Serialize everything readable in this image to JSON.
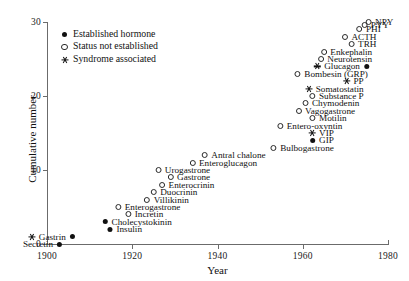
{
  "chart_data": {
    "type": "scatter",
    "title": "",
    "xlabel": "Year",
    "ylabel": "Cumulative number",
    "xlim": [
      1900,
      1980
    ],
    "ylim": [
      0,
      30
    ],
    "xticks": [
      "1900",
      "1920",
      "1940",
      "1960",
      "1980"
    ],
    "xtick_values": [
      1900,
      1920,
      1940,
      1960,
      1980
    ],
    "yticks": [
      "0",
      "10",
      "20",
      "30"
    ],
    "ytick_values": [
      0,
      10,
      20,
      30
    ],
    "grid": false,
    "legend_position": "top-left",
    "legend": [
      {
        "marker": "filled-circle",
        "label": "Established hormone"
      },
      {
        "marker": "open-circle",
        "label": "Status not established"
      },
      {
        "marker": "star",
        "label": "Syndrome associated"
      }
    ],
    "points": [
      {
        "label": "Secretin",
        "year": 1902,
        "value": 0,
        "markers": [
          "filled-circle"
        ],
        "marker_side": "right"
      },
      {
        "label": "Gastrin",
        "year": 1905,
        "value": 1,
        "markers": [
          "star",
          "filled-circle"
        ],
        "marker_side": "both"
      },
      {
        "label": "Insulin",
        "year": 1921,
        "value": 2,
        "markers": [
          "filled-circle"
        ],
        "marker_side": "left"
      },
      {
        "label": "Cholecystokinin",
        "year": 1928,
        "value": 3,
        "markers": [
          "filled-circle"
        ],
        "marker_side": "left"
      },
      {
        "label": "Incretin",
        "year": 1926,
        "value": 4,
        "markers": [
          "open-circle"
        ],
        "marker_side": "left"
      },
      {
        "label": "Enterogastrone",
        "year": 1930,
        "value": 5,
        "markers": [
          "open-circle"
        ],
        "marker_side": "left"
      },
      {
        "label": "Villikinin",
        "year": 1932,
        "value": 6,
        "markers": [
          "open-circle"
        ],
        "marker_side": "left"
      },
      {
        "label": "Duocrinin",
        "year": 1934,
        "value": 7,
        "markers": [
          "open-circle"
        ],
        "marker_side": "left"
      },
      {
        "label": "Enterocrinin",
        "year": 1938,
        "value": 8,
        "markers": [
          "open-circle"
        ],
        "marker_side": "left"
      },
      {
        "label": "Gastrone",
        "year": 1937,
        "value": 9,
        "markers": [
          "open-circle"
        ],
        "marker_side": "left"
      },
      {
        "label": "Urogastrone",
        "year": 1937,
        "value": 10,
        "markers": [
          "open-circle"
        ],
        "marker_side": "left"
      },
      {
        "label": "Enteroglucagon",
        "year": 1948,
        "value": 11,
        "markers": [
          "open-circle"
        ],
        "marker_side": "left"
      },
      {
        "label": "Antral chalone",
        "year": 1950,
        "value": 12,
        "markers": [
          "open-circle"
        ],
        "marker_side": "left"
      },
      {
        "label": "Bulbogastrone",
        "year": 1966,
        "value": 13,
        "markers": [
          "open-circle"
        ],
        "marker_side": "left"
      },
      {
        "label": "GIP",
        "year": 1966,
        "value": 14,
        "markers": [
          "filled-circle"
        ],
        "marker_side": "left"
      },
      {
        "label": "VIP",
        "year": 1966,
        "value": 15,
        "markers": [
          "star"
        ],
        "marker_side": "left"
      },
      {
        "label": "Entero-oxyntin",
        "year": 1968,
        "value": 16,
        "markers": [
          "open-circle"
        ],
        "marker_side": "left"
      },
      {
        "label": "Motilin",
        "year": 1969,
        "value": 17,
        "markers": [
          "open-circle"
        ],
        "marker_side": "left"
      },
      {
        "label": "Vagogastrone",
        "year": 1971,
        "value": 18,
        "markers": [
          "open-circle"
        ],
        "marker_side": "left"
      },
      {
        "label": "Chymodenin",
        "year": 1972,
        "value": 19,
        "markers": [
          "open-circle"
        ],
        "marker_side": "left"
      },
      {
        "label": "Substance P",
        "year": 1973,
        "value": 20,
        "markers": [
          "open-circle"
        ],
        "marker_side": "left"
      },
      {
        "label": "Somatostatin",
        "year": 1973,
        "value": 21,
        "markers": [
          "star"
        ],
        "marker_side": "left"
      },
      {
        "label": "PP",
        "year": 1973,
        "value": 22,
        "markers": [
          "star"
        ],
        "marker_side": "left"
      },
      {
        "label": "Bombesin (GRP)",
        "year": 1974,
        "value": 23,
        "markers": [
          "open-circle"
        ],
        "marker_side": "left"
      },
      {
        "label": "Glucagon",
        "year": 1974,
        "value": 24,
        "markers": [
          "star",
          "filled-circle"
        ],
        "marker_side": "both"
      },
      {
        "label": "Neurotensin",
        "year": 1975,
        "value": 25,
        "markers": [
          "open-circle"
        ],
        "marker_side": "left"
      },
      {
        "label": "Enkephalin",
        "year": 1975,
        "value": 26,
        "markers": [
          "open-circle"
        ],
        "marker_side": "left"
      },
      {
        "label": "TRH",
        "year": 1976,
        "value": 27,
        "markers": [
          "open-circle"
        ],
        "marker_side": "left"
      },
      {
        "label": "ACTH",
        "year": 1976,
        "value": 28,
        "markers": [
          "open-circle"
        ],
        "marker_side": "left"
      },
      {
        "label": "PHI",
        "year": 1977,
        "value": 29,
        "markers": [
          "open-circle"
        ],
        "marker_side": "left"
      },
      {
        "label": "PYY",
        "year": 1979,
        "value": 29.6,
        "markers": [
          "open-circle"
        ],
        "marker_side": "left"
      },
      {
        "label": "NPY",
        "year": 1980,
        "value": 30,
        "markers": [
          "open-circle"
        ],
        "marker_side": "left"
      }
    ]
  }
}
